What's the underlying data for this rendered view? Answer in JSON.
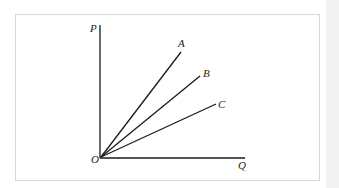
{
  "diagram": {
    "type": "rays-from-origin",
    "axes": {
      "y_label": "P",
      "x_label": "Q",
      "origin_label": "O"
    },
    "rays": [
      {
        "label": "A",
        "slope_rank": "steepest"
      },
      {
        "label": "B",
        "slope_rank": "middle"
      },
      {
        "label": "C",
        "slope_rank": "flattest"
      }
    ],
    "colors": {
      "line": "#1a1a1a",
      "frame": "#d6d6d6",
      "background": "#ffffff"
    }
  }
}
